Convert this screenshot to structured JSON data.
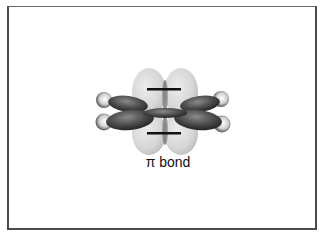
{
  "diagram": {
    "title": "π bond",
    "label": "π bond",
    "components": {
      "pi_lobes": {
        "count": 4,
        "color": "#d8d8d8",
        "signs": [
          "−",
          "−"
        ]
      },
      "carbon_lobes": {
        "count": 4,
        "color": "#4a4a4a"
      },
      "hydrogen_atoms": {
        "count": 4,
        "color": "#e8e8e8"
      },
      "sigma_bond": {
        "color": "#555555"
      }
    }
  }
}
